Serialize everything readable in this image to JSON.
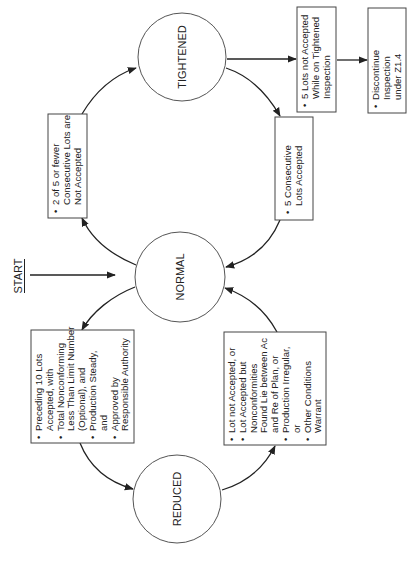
{
  "diagram": {
    "orientation": "rotated-90-ccw",
    "start_label": "START",
    "states": {
      "tightened": {
        "label": "TIGHTENED"
      },
      "normal": {
        "label": "NORMAL"
      },
      "reduced": {
        "label": "REDUCED"
      }
    },
    "conditions": {
      "normal_to_tightened": {
        "bullets": [
          [
            "2 of 5 or fewer",
            "Consecutive Lots are",
            "Not Accepted"
          ]
        ]
      },
      "tightened_to_normal": {
        "bullets": [
          [
            "5 Consecutive",
            "Lots Accepted"
          ]
        ]
      },
      "tightened_to_discontinue": {
        "bullets": [
          [
            "5 Lots not Accepted",
            "While on Tightened",
            "Inspection"
          ]
        ]
      },
      "discontinue": {
        "bullets": [
          [
            "Discontinue",
            "Inspection",
            "under Z1.4"
          ]
        ]
      },
      "normal_to_reduced": {
        "lines": [
          {
            "bullet": true,
            "text": "Preceding 10 Lots"
          },
          {
            "bullet": false,
            "text": "Accepted, with"
          },
          {
            "bullet": true,
            "text": "Total Nonconforming"
          },
          {
            "bullet": false,
            "text": "Less Than Limit Number"
          },
          {
            "bullet": false,
            "text": "(Optional), and"
          },
          {
            "bullet": true,
            "text": "Production Steady,"
          },
          {
            "bullet": false,
            "text": "and"
          },
          {
            "bullet": true,
            "text": "Approved by"
          },
          {
            "bullet": false,
            "text": "Responsible Authority"
          }
        ]
      },
      "reduced_to_normal": {
        "lines": [
          {
            "bullet": true,
            "text": "Lot not Accepted, or"
          },
          {
            "bullet": true,
            "text": "Lot Accepted but"
          },
          {
            "bullet": false,
            "text": "Nonconformities"
          },
          {
            "bullet": false,
            "text": "Found Lie between Ac"
          },
          {
            "bullet": false,
            "text": "and Re of Plan, or"
          },
          {
            "bullet": true,
            "text": "Production Irregular,"
          },
          {
            "bullet": false,
            "text": "or"
          },
          {
            "bullet": true,
            "text": "Other Conditions"
          },
          {
            "bullet": false,
            "text": "Warrant"
          }
        ]
      }
    },
    "bullet_glyph": "•",
    "colors": {
      "line": "#222222",
      "background": "#ffffff"
    }
  }
}
